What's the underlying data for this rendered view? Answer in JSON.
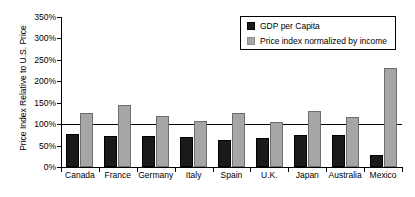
{
  "chart_data": {
    "type": "bar",
    "title": "",
    "xlabel": "",
    "ylabel": "Price Index Relative to U.S. Price",
    "ylim": [
      0,
      350
    ],
    "ytick_step": 50,
    "ytick_labels": [
      "0%",
      "50%",
      "100%",
      "150%",
      "200%",
      "250%",
      "300%",
      "350%"
    ],
    "ytick_values": [
      0,
      50,
      100,
      150,
      200,
      250,
      300,
      350
    ],
    "grid": false,
    "reference_line": 100,
    "legend_position": "top-right",
    "categories": [
      "Canada",
      "France",
      "Germany",
      "Italy",
      "Spain",
      "U.K.",
      "Japan",
      "Australia",
      "Mexico"
    ],
    "series": [
      {
        "name": "GDP per Capita",
        "color": "#1a1a1a",
        "values": [
          77,
          72,
          72,
          70,
          63,
          68,
          74,
          74,
          28
        ]
      },
      {
        "name": "Price index normalized by income",
        "color": "#a6a6a6",
        "values": [
          126,
          145,
          120,
          108,
          126,
          104,
          130,
          117,
          231
        ]
      }
    ]
  },
  "legend": {
    "items": [
      {
        "label": "GDP per Capita"
      },
      {
        "label": "Price index normalized by income"
      }
    ]
  }
}
